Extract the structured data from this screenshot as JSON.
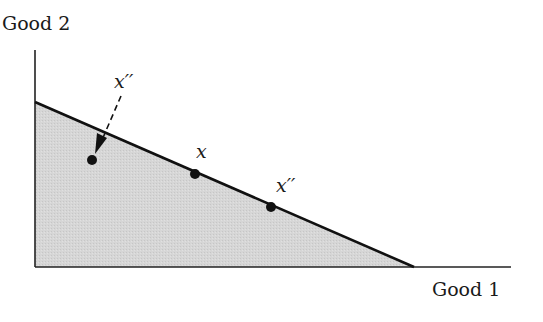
{
  "diagram": {
    "type": "budget-set",
    "axes": {
      "y_label": "Good 2",
      "x_label": "Good 1"
    },
    "points": {
      "interior": {
        "label": "x'"
      },
      "on_line_x": {
        "label": "x"
      },
      "on_line_x_double_prime": {
        "label": "x''"
      },
      "arrow_source": {
        "label": "x''"
      }
    },
    "colors": {
      "line": "#111111",
      "shading": "#d4d4d4",
      "background": "#ffffff"
    }
  },
  "labels": {
    "good2": "Good 2",
    "good1": "Good 1",
    "x": "x",
    "x_double_prime_on_line": "x′′",
    "x_double_prime_top": "x′′"
  }
}
